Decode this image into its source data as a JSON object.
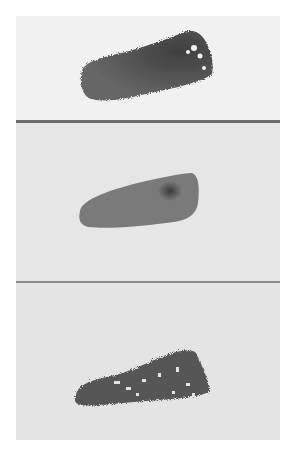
{
  "image": {
    "description": "Three paint swatch samples on different paper textures, stacked vertically",
    "panels": [
      {
        "id": "top",
        "paper_color": "#f1f1f1",
        "swatch_color": "#5e5e5e",
        "swatch_texture": "dry-brush edge, darker upper right"
      },
      {
        "id": "middle",
        "paper_color": "#e6e6e6",
        "swatch_color": "#7a7a7a",
        "swatch_texture": "smooth wedge with dark spot"
      },
      {
        "id": "bottom",
        "paper_color": "#e4e4e4",
        "swatch_color": "#575757",
        "swatch_texture": "granulated, broken dry-brush"
      }
    ],
    "divider_colors": [
      "#6b6b6b",
      "#8a8a8a"
    ]
  }
}
